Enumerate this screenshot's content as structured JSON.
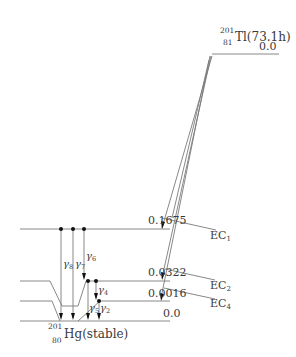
{
  "parent": {
    "mass": "201",
    "atomic_number": "81",
    "symbol_halflife": "Tl(73.1h)",
    "level_energy": "0.0"
  },
  "daughter": {
    "mass": "201",
    "atomic_number": "80",
    "symbol_halflife": "Hg(stable)"
  },
  "levels": [
    {
      "energy": "0.1675"
    },
    {
      "energy": "0.0322"
    },
    {
      "energy": "0.0016"
    },
    {
      "energy": "0.0"
    }
  ],
  "ec_branches": [
    {
      "label": "EC",
      "sub": "1"
    },
    {
      "label": "EC",
      "sub": "2"
    },
    {
      "label": "EC",
      "sub": "4"
    }
  ],
  "gammas": [
    {
      "symbol": "γ",
      "sub": "8"
    },
    {
      "symbol": "γ",
      "sub": "7"
    },
    {
      "symbol": "γ",
      "sub": "6"
    },
    {
      "symbol": "γ",
      "sub": "4"
    },
    {
      "symbol": "γ",
      "sub": "5"
    },
    {
      "symbol": "γ",
      "sub": "2"
    }
  ],
  "colors": {
    "line": "#7a7a7a",
    "text": "#3a3a3a",
    "background": "#ffffff"
  }
}
